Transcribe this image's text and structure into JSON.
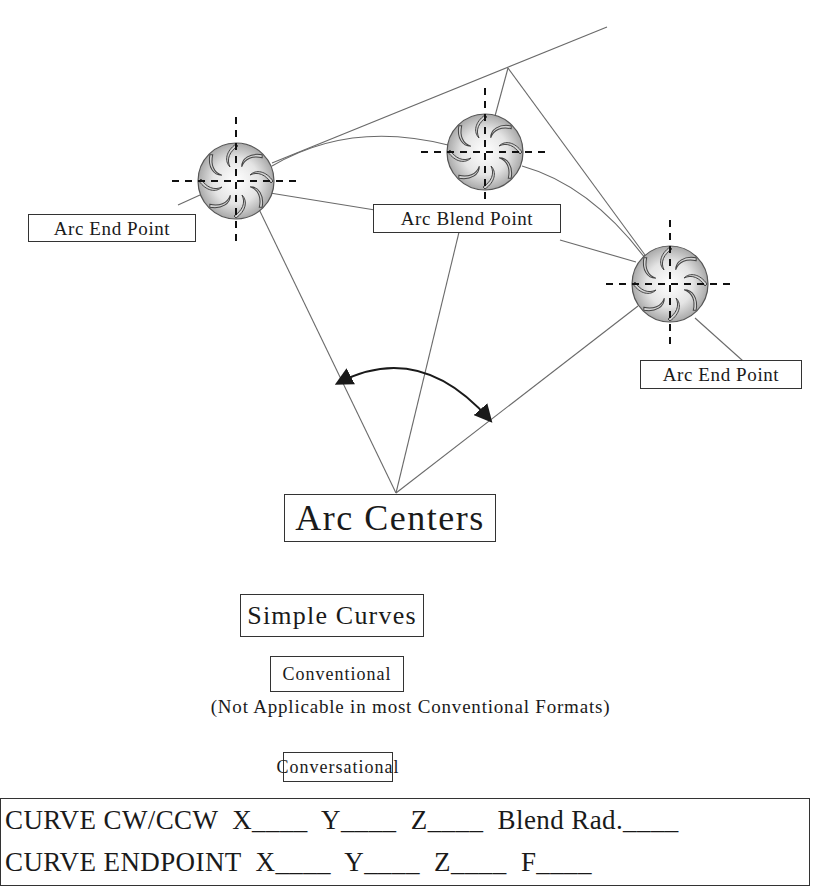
{
  "figure": {
    "title": "Simple Curves",
    "labels": {
      "arc_end_point_left": "Arc End Point",
      "arc_blend_point": "Arc Blend Point",
      "arc_end_point_right": "Arc End Point",
      "arc_centers": "Arc Centers"
    },
    "icons": [
      "milling-cutter-icon",
      "milling-cutter-icon",
      "milling-cutter-icon"
    ],
    "colors": {
      "line": "#6a6a6a",
      "ink": "#1a1a1a",
      "box_border": "#333333",
      "cutter_shade": "#9a9a9a"
    }
  },
  "sections": {
    "conventional": {
      "heading": "Conventional",
      "note": "(Not Applicable in most Conventional Formats)"
    },
    "conversational": {
      "heading": "Conversational",
      "lines": [
        "CURVE CW/CCW  X____  Y____  Z____  Blend Rad.____",
        "CURVE ENDPOINT  X____  Y____  Z____  F____"
      ]
    }
  }
}
